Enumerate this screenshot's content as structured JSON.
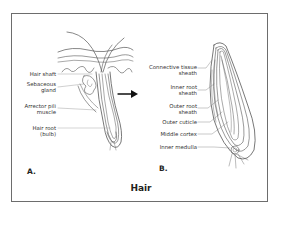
{
  "figure": {
    "caption": "Hair",
    "panel_a": {
      "letter": "A.",
      "labels": [
        {
          "text": "Hair shaft"
        },
        {
          "text": "Sebaceous",
          "text2": "gland"
        },
        {
          "text": "Arrector pili",
          "text2": "muscle"
        },
        {
          "text": "Hair root",
          "text2": "(bulb)"
        }
      ]
    },
    "panel_b": {
      "letter": "B.",
      "labels": [
        {
          "text": "Connective tissue",
          "text2": "sheath"
        },
        {
          "text": "Inner root",
          "text2": "sheath"
        },
        {
          "text": "Outer root",
          "text2": "sheath"
        },
        {
          "text": "Outer cuticle"
        },
        {
          "text": "Middle cortex"
        },
        {
          "text": "Inner medulla"
        }
      ]
    },
    "arrow": {
      "icon": "right-arrow-icon",
      "meaning": "enlarged view"
    },
    "colors": {
      "line": "#555555",
      "text": "#231f20",
      "frame": "#6d6d6d"
    }
  }
}
